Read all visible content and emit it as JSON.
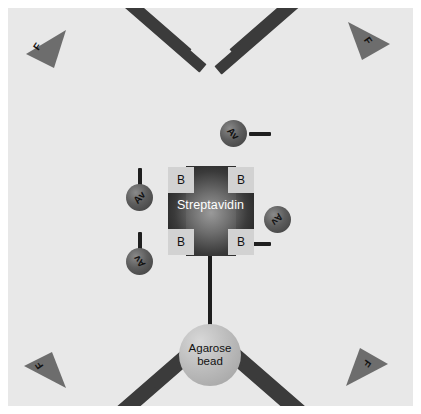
{
  "diagram": {
    "background_color": "#e8e8e8",
    "center": {
      "label": "Streptavidin",
      "shape": "cross",
      "color": "#4a4a4a",
      "biotin_boxes": [
        {
          "label": "B",
          "position": "top-left"
        },
        {
          "label": "B",
          "position": "top-right"
        },
        {
          "label": "B",
          "position": "bottom-left"
        },
        {
          "label": "B",
          "position": "bottom-right"
        }
      ]
    },
    "bead": {
      "label_line1": "Agarose",
      "label_line2": "bead",
      "color": "#bdbdbd"
    },
    "arms": [
      {
        "id": "top-left",
        "avidin_label": "Av",
        "fab_label": "F",
        "rod_color": "#3b3b3b"
      },
      {
        "id": "top-right",
        "avidin_label": "Av",
        "fab_label": "F",
        "rod_color": "#3b3b3b"
      },
      {
        "id": "bottom-left",
        "avidin_label": "Av",
        "fab_label": "F",
        "rod_color": "#3b3b3b"
      },
      {
        "id": "bottom-right",
        "avidin_label": "Av",
        "fab_label": "F",
        "rod_color": "#3b3b3b"
      }
    ]
  }
}
